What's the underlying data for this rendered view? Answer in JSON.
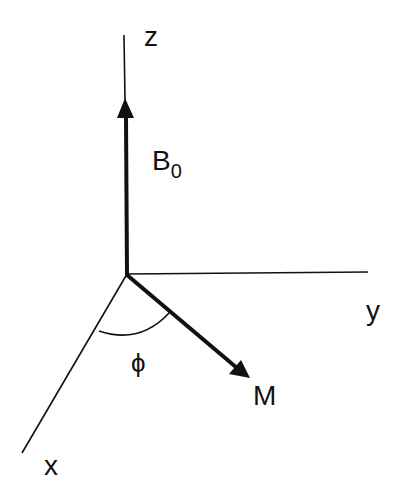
{
  "diagram": {
    "labels": {
      "z_axis": "z",
      "y_axis": "y",
      "x_axis": "x",
      "field": "B",
      "field_subscript": "0",
      "magnetization": "M",
      "angle": "ϕ"
    },
    "colors": {
      "background": "#ffffff",
      "ink": "#111111"
    }
  }
}
